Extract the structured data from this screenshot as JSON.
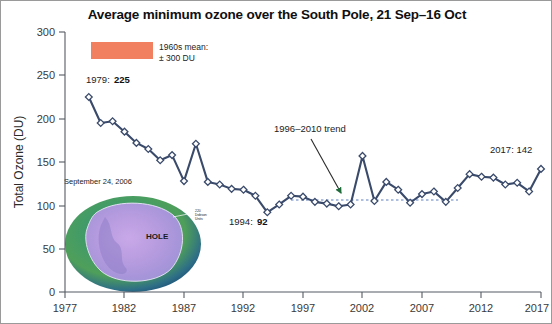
{
  "figure": {
    "title": "Average minimum ozone over the South Pole, 21 Sep–16 Oct",
    "border_color": "#9a9a9a",
    "background": "#ffffff"
  },
  "legend": {
    "swatch_color": "#F08060",
    "line1": "1960s mean:",
    "line2": "± 300 DU"
  },
  "annotations": {
    "first_year_prefix": "1979: ",
    "first_year_value": "225",
    "min_year_prefix": "1994: ",
    "min_year_value": "92",
    "trend_label": "1996–2010 trend",
    "last_year_label": "2017: 142"
  },
  "inset": {
    "caption": "September 24, 2006",
    "hole_label": "HOLE",
    "edge_label_line1": "220",
    "edge_label_line2": "Dobson",
    "edge_label_line3": "Units"
  },
  "chart_data": {
    "type": "line",
    "title": "Average minimum ozone over the South Pole, 21 Sep–16 Oct",
    "xlabel": "",
    "ylabel": "Total Ozone (DU)",
    "xlim": [
      1977,
      2017
    ],
    "ylim": [
      0,
      300
    ],
    "xticks": [
      1977,
      1982,
      1987,
      1992,
      1997,
      2002,
      2007,
      2012,
      2017
    ],
    "yticks": [
      0,
      50,
      100,
      150,
      200,
      250,
      300
    ],
    "grid": false,
    "legend_position": "top-left",
    "marker": "diamond",
    "line_color": "#3a4a6b",
    "marker_face": "#ffffff",
    "x": [
      1979,
      1980,
      1981,
      1982,
      1983,
      1984,
      1985,
      1986,
      1987,
      1988,
      1989,
      1990,
      1991,
      1992,
      1993,
      1994,
      1995,
      1996,
      1997,
      1998,
      1999,
      2000,
      2001,
      2002,
      2003,
      2004,
      2005,
      2006,
      2007,
      2008,
      2009,
      2010,
      2011,
      2012,
      2013,
      2014,
      2015,
      2016,
      2017
    ],
    "values": [
      225,
      195,
      197,
      185,
      172,
      165,
      152,
      158,
      128,
      171,
      127,
      124,
      119,
      118,
      111,
      92,
      101,
      111,
      110,
      104,
      102,
      99,
      101,
      157,
      105,
      127,
      118,
      103,
      113,
      116,
      104,
      120,
      136,
      133,
      132,
      124,
      126,
      116,
      142
    ],
    "series": [
      {
        "name": "Average minimum ozone (DU)",
        "values": [
          225,
          195,
          197,
          185,
          172,
          165,
          152,
          158,
          128,
          171,
          127,
          124,
          119,
          118,
          111,
          92,
          101,
          111,
          110,
          104,
          102,
          99,
          101,
          157,
          105,
          127,
          118,
          103,
          113,
          116,
          104,
          120,
          136,
          133,
          132,
          124,
          126,
          116,
          142
        ]
      }
    ],
    "trend_line": {
      "label": "1996–2010 trend",
      "x_start": 1996,
      "x_end": 2010,
      "y_value": 106,
      "style": "dotted",
      "color": "#5f7fbf"
    },
    "reference_band": {
      "label": "1960s mean: ± 300 DU",
      "value": 300,
      "color": "#F08060"
    },
    "annotations": [
      {
        "year": 1979,
        "value": 225,
        "text": "1979: 225"
      },
      {
        "year": 1994,
        "value": 92,
        "text": "1994: 92"
      },
      {
        "year": 2017,
        "value": 142,
        "text": "2017: 142"
      }
    ]
  }
}
